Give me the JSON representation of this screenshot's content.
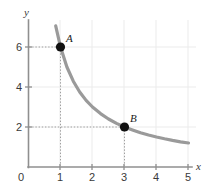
{
  "chart_data": {
    "type": "line",
    "title": "",
    "subtitle": "",
    "xlabel": "x",
    "ylabel": "y",
    "xlim": [
      0,
      5.2
    ],
    "ylim": [
      0,
      7.4
    ],
    "grid": true,
    "grid_color": "#e8e8e8",
    "axis_color": "#8a8a8a",
    "curve_color": "#9a9a9a",
    "point_color": "#111111",
    "guide_color": "#aaaaaa",
    "legend": null,
    "legend_position": "none",
    "x_ticks": [
      {
        "value": 0,
        "label": "0"
      },
      {
        "value": 1,
        "label": "1"
      },
      {
        "value": 2,
        "label": "2"
      },
      {
        "value": 3,
        "label": "3"
      },
      {
        "value": 4,
        "label": "4"
      },
      {
        "value": 5,
        "label": "5"
      }
    ],
    "y_ticks": [
      {
        "value": 2,
        "label": "2"
      },
      {
        "value": 4,
        "label": "4"
      },
      {
        "value": 6,
        "label": "6"
      }
    ],
    "origin_label": "0",
    "series": [
      {
        "name": "y = 6/x",
        "equation": "y = 6/x",
        "x": [
          0.85,
          1.0,
          1.2,
          1.4,
          1.6,
          1.8,
          2.0,
          2.25,
          2.5,
          2.75,
          3.0,
          3.25,
          3.5,
          3.75,
          4.0,
          4.25,
          4.5,
          4.75,
          5.0
        ],
        "values": [
          7.06,
          6.0,
          5.0,
          4.29,
          3.75,
          3.33,
          3.0,
          2.67,
          2.4,
          2.18,
          2.0,
          1.85,
          1.71,
          1.6,
          1.5,
          1.41,
          1.33,
          1.26,
          1.2
        ]
      }
    ],
    "points": [
      {
        "label": "A",
        "x": 1,
        "y": 6,
        "guides": true
      },
      {
        "label": "B",
        "x": 3,
        "y": 2,
        "guides": true
      }
    ],
    "annotations": []
  }
}
